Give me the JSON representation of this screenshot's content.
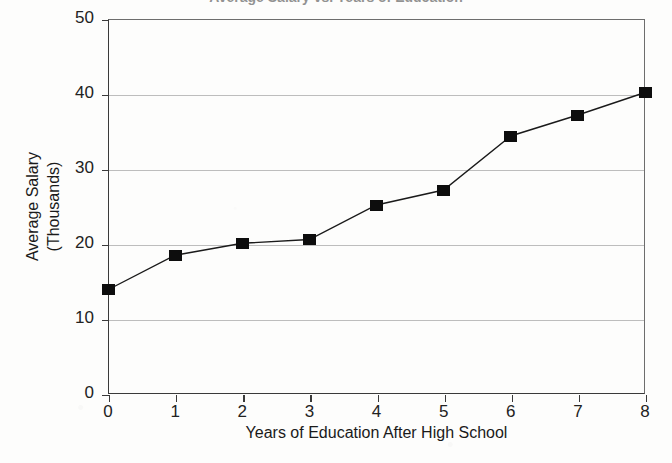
{
  "figure": {
    "clipped_title": "Average Salary vs. Years of Education",
    "background_color": "#fdfdfc",
    "line_color": "#1a1a1a",
    "marker_color": "#0d0d0d",
    "grid_color": "#bdbdbd",
    "axis_color": "#3a3a3a"
  },
  "chart_data": {
    "type": "line",
    "title": "",
    "xlabel": "Years of Education After High School",
    "ylabel": "Average Salary (Thousands)",
    "ylabel_line1": "Average Salary",
    "ylabel_line2": "(Thousands)",
    "x": [
      0,
      1,
      2,
      3,
      4,
      5,
      6,
      7,
      8
    ],
    "values": [
      13.9,
      18.5,
      20.1,
      20.6,
      25.2,
      27.2,
      34.4,
      37.2,
      40.2
    ],
    "xlim": [
      0,
      8
    ],
    "ylim": [
      0,
      50
    ],
    "xticks": [
      "0",
      "1",
      "2",
      "3",
      "4",
      "5",
      "6",
      "7",
      "8"
    ],
    "yticks": [
      "0",
      "10",
      "20",
      "30",
      "40",
      "50"
    ],
    "ytick_values": [
      0,
      10,
      20,
      30,
      40,
      50
    ],
    "grid": "horizontal",
    "legend": "none",
    "marker": "square"
  }
}
